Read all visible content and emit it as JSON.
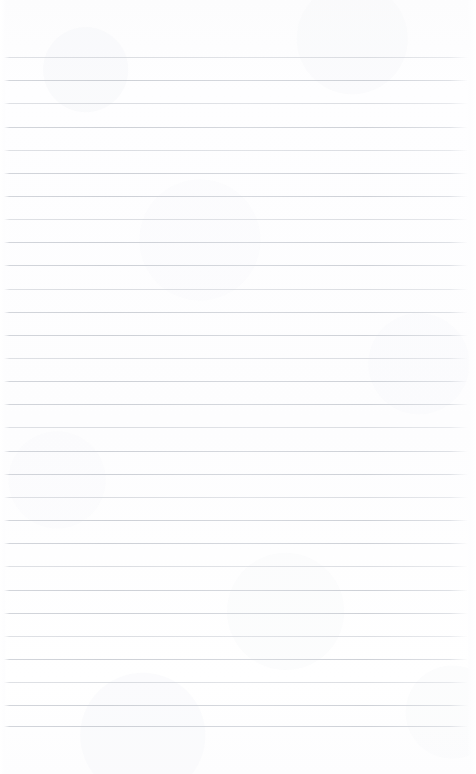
{
  "document": {
    "kind": "lined-paper",
    "title": "Blank ruled notebook page",
    "page_width": 476,
    "page_height": 774,
    "background_color": "#fdfdfe",
    "rule_color": "#d0d3d9",
    "has_text_content": false,
    "written_text": ""
  },
  "layout": {
    "top_margin": 57,
    "bottom_margin": 48,
    "left_inset": 4,
    "right_inset": 8,
    "line_spacing": 23.15,
    "line_count": 30,
    "line_thickness": 1,
    "has_left_margin_rule": false,
    "has_header_rule": false
  },
  "rules": {
    "y_positions": [
      57.0,
      80.2,
      103.3,
      126.5,
      149.6,
      172.8,
      195.9,
      219.1,
      242.2,
      265.4,
      288.5,
      311.7,
      334.8,
      358.0,
      381.1,
      404.3,
      427.4,
      450.6,
      473.7,
      496.9,
      520.0,
      543.2,
      566.3,
      589.5,
      612.6,
      635.8,
      658.9,
      682.1,
      705.2,
      726.0
    ],
    "weights": [
      "faint",
      "strong",
      "faint",
      "strong",
      "faint",
      "strong",
      "strong",
      "faint",
      "strong",
      "strong",
      "faint",
      "strong",
      "strong",
      "faint",
      "strong",
      "strong",
      "faint",
      "strong",
      "strong",
      "faint",
      "strong",
      "strong",
      "faint",
      "strong",
      "strong",
      "faint",
      "strong",
      "faint",
      "strong",
      "strong"
    ]
  }
}
